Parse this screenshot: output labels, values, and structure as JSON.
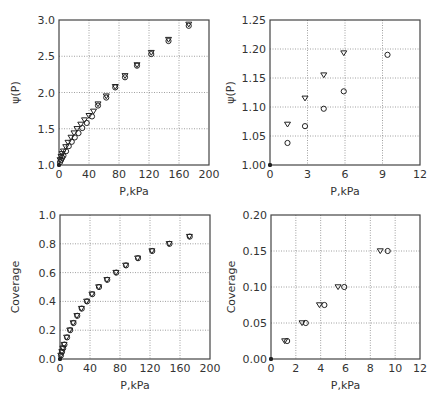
{
  "chart_data": [
    {
      "id": "top-left",
      "type": "scatter",
      "title": "",
      "xlabel": "P,kPa",
      "ylabel": "ψ(P)",
      "xlim": [
        0,
        200
      ],
      "ylim": [
        1.0,
        3.0
      ],
      "xticks": [
        0,
        40,
        80,
        120,
        160,
        200
      ],
      "yticks": [
        1.0,
        1.5,
        2.0,
        2.5,
        3.0
      ],
      "xtick_labels": [
        "0",
        "40",
        "80",
        "120",
        "160",
        "200"
      ],
      "ytick_labels": [
        "1.0",
        "1.5",
        "2.0",
        "2.5",
        "3.0"
      ],
      "grid": true,
      "frame": {
        "x0": 59,
        "y0": 20,
        "x1": 209,
        "y1": 165
      },
      "series": [
        {
          "name": "circles",
          "marker": "circle",
          "points": [
            [
              0,
              1.0
            ],
            [
              1.4,
              1.04
            ],
            [
              2.8,
              1.07
            ],
            [
              4.3,
              1.1
            ],
            [
              5.9,
              1.13
            ],
            [
              9.4,
              1.19
            ],
            [
              13,
              1.26
            ],
            [
              17,
              1.32
            ],
            [
              21,
              1.38
            ],
            [
              26,
              1.44
            ],
            [
              31,
              1.51
            ],
            [
              37,
              1.58
            ],
            [
              44,
              1.67
            ],
            [
              52,
              1.82
            ],
            [
              63,
              1.93
            ],
            [
              75,
              2.07
            ],
            [
              88,
              2.21
            ],
            [
              104,
              2.37
            ],
            [
              123,
              2.53
            ],
            [
              146,
              2.71
            ],
            [
              173,
              2.92
            ]
          ]
        },
        {
          "name": "triangles",
          "marker": "triangle-down",
          "points": [
            [
              0,
              1.0
            ],
            [
              1.4,
              1.07
            ],
            [
              2.8,
              1.115
            ],
            [
              4.3,
              1.155
            ],
            [
              5.9,
              1.19
            ],
            [
              9,
              1.25
            ],
            [
              12,
              1.31
            ],
            [
              16,
              1.38
            ],
            [
              20,
              1.44
            ],
            [
              24,
              1.5
            ],
            [
              29,
              1.56
            ],
            [
              34,
              1.62
            ],
            [
              40,
              1.68
            ],
            [
              46,
              1.74
            ],
            [
              52,
              1.84
            ],
            [
              63,
              1.95
            ],
            [
              75,
              2.08
            ],
            [
              88,
              2.23
            ],
            [
              104,
              2.38
            ],
            [
              123,
              2.55
            ],
            [
              146,
              2.73
            ],
            [
              173,
              2.94
            ]
          ]
        }
      ]
    },
    {
      "id": "top-right",
      "type": "scatter",
      "title": "",
      "xlabel": "P,kPa",
      "ylabel": "ψ(P)",
      "xlim": [
        0,
        12
      ],
      "ylim": [
        1.0,
        1.25
      ],
      "xticks": [
        0,
        3,
        6,
        9,
        12
      ],
      "yticks": [
        1.0,
        1.05,
        1.1,
        1.15,
        1.2,
        1.25
      ],
      "xtick_labels": [
        "0",
        "3",
        "6",
        "9",
        "12"
      ],
      "ytick_labels": [
        "1.00",
        "1.05",
        "1.10",
        "1.15",
        "1.20",
        "1.25"
      ],
      "grid": true,
      "frame": {
        "x0": 270,
        "y0": 20,
        "x1": 420,
        "y1": 165
      },
      "series": [
        {
          "name": "circles",
          "marker": "circle",
          "points": [
            [
              0,
              1.0
            ],
            [
              1.4,
              1.038
            ],
            [
              2.8,
              1.067
            ],
            [
              4.3,
              1.097
            ],
            [
              5.9,
              1.127
            ],
            [
              9.4,
              1.19
            ]
          ]
        },
        {
          "name": "triangles",
          "marker": "triangle-down",
          "points": [
            [
              0,
              1.0
            ],
            [
              1.4,
              1.07
            ],
            [
              2.8,
              1.115
            ],
            [
              4.3,
              1.155
            ],
            [
              5.9,
              1.193
            ]
          ]
        }
      ]
    },
    {
      "id": "bottom-left",
      "type": "scatter",
      "title": "",
      "xlabel": "P,kPa",
      "ylabel": "Coverage",
      "xlim": [
        0,
        200
      ],
      "ylim": [
        0.0,
        1.0
      ],
      "xticks": [
        0,
        40,
        80,
        120,
        160,
        200
      ],
      "yticks": [
        0.0,
        0.2,
        0.4,
        0.6,
        0.8,
        1.0
      ],
      "xtick_labels": [
        "0",
        "40",
        "80",
        "120",
        "160",
        "200"
      ],
      "ytick_labels": [
        "0.0",
        "0.2",
        "0.4",
        "0.6",
        "0.8",
        "1.0"
      ],
      "grid": true,
      "frame": {
        "x0": 60,
        "y0": 215,
        "x1": 210,
        "y1": 359
      },
      "series": [
        {
          "name": "circles",
          "marker": "circle",
          "points": [
            [
              0,
              0.0
            ],
            [
              1.3,
              0.025
            ],
            [
              2.7,
              0.05
            ],
            [
              4.2,
              0.075
            ],
            [
              5.9,
              0.1
            ],
            [
              9.4,
              0.15
            ],
            [
              13.5,
              0.2
            ],
            [
              18,
              0.25
            ],
            [
              23,
              0.3
            ],
            [
              29,
              0.35
            ],
            [
              36,
              0.4
            ],
            [
              43,
              0.45
            ],
            [
              52,
              0.5
            ],
            [
              63,
              0.55
            ],
            [
              75,
              0.6
            ],
            [
              88,
              0.65
            ],
            [
              104,
              0.7
            ],
            [
              123,
              0.75
            ],
            [
              146,
              0.8
            ],
            [
              173,
              0.85
            ]
          ]
        },
        {
          "name": "triangles",
          "marker": "triangle-down",
          "points": [
            [
              0,
              0.0
            ],
            [
              1.1,
              0.025
            ],
            [
              2.4,
              0.05
            ],
            [
              3.8,
              0.075
            ],
            [
              5.4,
              0.1
            ],
            [
              8.8,
              0.15
            ],
            [
              13,
              0.2
            ],
            [
              17.5,
              0.25
            ],
            [
              22.5,
              0.3
            ],
            [
              28.5,
              0.35
            ],
            [
              35.5,
              0.4
            ],
            [
              42.5,
              0.45
            ],
            [
              51.5,
              0.5
            ],
            [
              62.5,
              0.55
            ],
            [
              74.5,
              0.6
            ],
            [
              87.5,
              0.65
            ],
            [
              103.5,
              0.7
            ],
            [
              122.5,
              0.75
            ],
            [
              145.5,
              0.8
            ],
            [
              172.5,
              0.85
            ]
          ]
        }
      ]
    },
    {
      "id": "bottom-right",
      "type": "scatter",
      "title": "",
      "xlabel": "P,kPa",
      "ylabel": "Coverage",
      "xlim": [
        0,
        12
      ],
      "ylim": [
        0.0,
        0.2
      ],
      "xticks": [
        0,
        2,
        4,
        6,
        8,
        10,
        12
      ],
      "yticks": [
        0.0,
        0.05,
        0.1,
        0.15,
        0.2
      ],
      "xtick_labels": [
        "0",
        "2",
        "4",
        "6",
        "8",
        "10",
        "12"
      ],
      "ytick_labels": [
        "0.00",
        "0.05",
        "0.10",
        "0.15",
        "0.20"
      ],
      "grid": true,
      "frame": {
        "x0": 271,
        "y0": 215,
        "x1": 420,
        "y1": 359
      },
      "series": [
        {
          "name": "circles",
          "marker": "circle",
          "points": [
            [
              0,
              0.0
            ],
            [
              1.3,
              0.025
            ],
            [
              2.8,
              0.05
            ],
            [
              4.3,
              0.075
            ],
            [
              5.9,
              0.1
            ],
            [
              9.4,
              0.15
            ]
          ]
        },
        {
          "name": "triangles",
          "marker": "triangle-down",
          "points": [
            [
              0,
              0.0
            ],
            [
              1.1,
              0.025
            ],
            [
              2.5,
              0.05
            ],
            [
              3.9,
              0.075
            ],
            [
              5.4,
              0.1
            ],
            [
              8.8,
              0.15
            ]
          ]
        }
      ]
    }
  ]
}
